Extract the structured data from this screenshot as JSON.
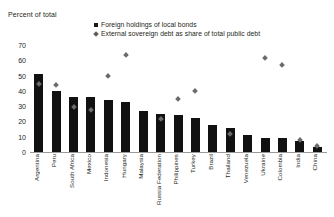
{
  "chart_data": {
    "type": "bar",
    "title": "Percent of total",
    "xlabel": "",
    "ylabel": "Percent of total",
    "ylim": [
      0,
      70
    ],
    "yticks": [
      70,
      60,
      50,
      40,
      30,
      20,
      10,
      0
    ],
    "grid": false,
    "legend_position": "top-center",
    "categories": [
      "Argentina",
      "Peru",
      "South Africa",
      "Mexico",
      "Indonesia",
      "Hungary",
      "Malaysia",
      "Russia Federation",
      "Philippines",
      "Turkey",
      "Brazil",
      "Thailand",
      "Venezuela",
      "Ukraine",
      "Colombia",
      "India",
      "China"
    ],
    "series": [
      {
        "name": "Foreign holdings of local bonds",
        "marker": "square",
        "color": "#111111",
        "values": [
          51,
          40,
          36,
          36,
          34,
          33,
          27,
          25,
          24,
          22,
          18,
          16,
          11,
          9,
          9,
          7,
          3
        ]
      },
      {
        "name": "External sovereign debt as share of total public debt",
        "marker": "diamond",
        "color": "#6b6b6b",
        "values": [
          45,
          44,
          30,
          28,
          50,
          64,
          null,
          22,
          35,
          40,
          null,
          12,
          null,
          62,
          57,
          8,
          4
        ]
      }
    ]
  },
  "legend": {
    "items": [
      {
        "label": "Foreign holdings of local bonds",
        "marker": "square"
      },
      {
        "label": "External sovereign debt as share of total public debt",
        "marker": "diamond"
      }
    ]
  },
  "colors": {
    "bar": "#111111",
    "diamond": "#6b6b6b",
    "axis": "#9a9a9a",
    "text": "#231f20",
    "background": "#ffffff"
  }
}
